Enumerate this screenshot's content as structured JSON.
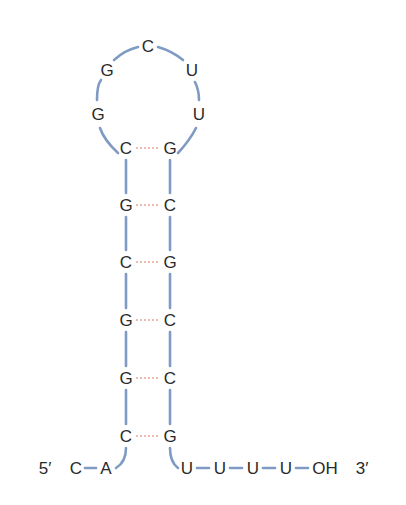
{
  "figure": {
    "type": "RNA stem-loop (hairpin) structure",
    "colors": {
      "backbone": "#7f9bc4",
      "hydrogen_bond": "#e07b6b",
      "text": "#2a2a2a"
    },
    "loop": {
      "nucleotides": [
        "G",
        "G",
        "C",
        "U",
        "U"
      ]
    },
    "stem": {
      "pairs": [
        {
          "left": "C",
          "right": "G"
        },
        {
          "left": "G",
          "right": "C"
        },
        {
          "left": "C",
          "right": "G"
        },
        {
          "left": "G",
          "right": "C"
        },
        {
          "left": "G",
          "right": "C"
        },
        {
          "left": "C",
          "right": "G"
        }
      ]
    },
    "five_prime": {
      "label": "5′",
      "nucleotides": [
        "C",
        "A"
      ]
    },
    "three_prime": {
      "nucleotides": [
        "U",
        "U",
        "U",
        "U"
      ],
      "terminal": "OH",
      "label": "3′"
    }
  }
}
